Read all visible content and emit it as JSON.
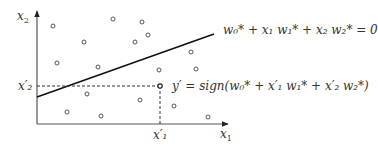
{
  "axes": {
    "x_label": "x",
    "x_label_sub": "1",
    "y_label": "x",
    "y_label_sub": "2"
  },
  "boundary": {
    "label": "w₀* + x₁ w₁* + x₂ w₂* = 0"
  },
  "query": {
    "x_tick": "x′₁",
    "y_tick": "x′₂",
    "prediction": "y′ = sign(w₀* + x′₁ w₁* + x′₂ w₂*)"
  },
  "colors": {
    "axis": "#444444",
    "line": "#111111",
    "points": "#555555",
    "text": "#333333"
  },
  "points": [
    [
      53,
      26
    ],
    [
      113,
      19
    ],
    [
      142,
      22
    ],
    [
      84,
      42
    ],
    [
      135,
      42
    ],
    [
      148,
      35
    ],
    [
      57,
      63
    ],
    [
      98,
      67
    ],
    [
      159,
      70
    ],
    [
      196,
      69
    ],
    [
      191,
      52
    ],
    [
      87,
      94
    ],
    [
      140,
      100
    ],
    [
      174,
      106
    ],
    [
      67,
      112
    ],
    [
      101,
      116
    ],
    [
      208,
      117
    ]
  ]
}
